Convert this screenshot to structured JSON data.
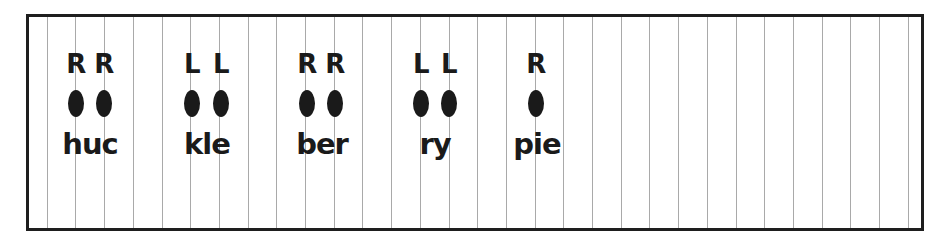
{
  "worksheet": {
    "colors": {
      "border": "#1e1e1e",
      "grid_line": "#a9a9a9",
      "ink": "#1a1a1a"
    },
    "grid": {
      "first_line_x": 46.7,
      "spacing": 28.7,
      "count": 31
    },
    "syllables": [
      {
        "text": "huc",
        "center_x": 90,
        "notes": [
          {
            "hand": "R",
            "x": 76
          },
          {
            "hand": "R",
            "x": 104
          }
        ]
      },
      {
        "text": "kle",
        "center_x": 207,
        "notes": [
          {
            "hand": "L",
            "x": 192
          },
          {
            "hand": "L",
            "x": 221
          }
        ]
      },
      {
        "text": "ber",
        "center_x": 322,
        "notes": [
          {
            "hand": "R",
            "x": 307
          },
          {
            "hand": "R",
            "x": 335
          }
        ]
      },
      {
        "text": "ry",
        "center_x": 435,
        "notes": [
          {
            "hand": "L",
            "x": 421
          },
          {
            "hand": "L",
            "x": 449
          }
        ]
      },
      {
        "text": "pie",
        "center_x": 537,
        "notes": [
          {
            "hand": "R",
            "x": 536
          }
        ]
      }
    ]
  }
}
